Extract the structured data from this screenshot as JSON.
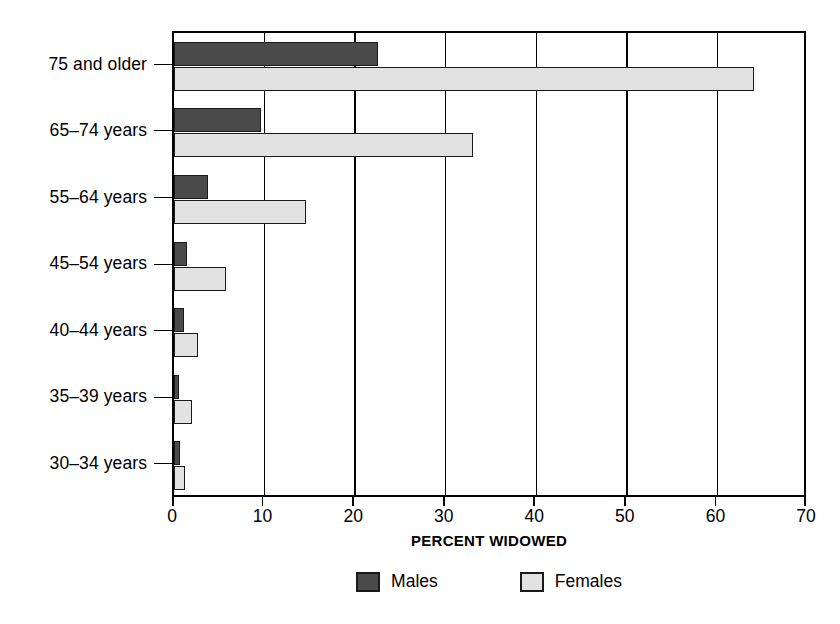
{
  "chart_data": {
    "type": "bar",
    "orientation": "horizontal",
    "title": "",
    "xlabel": "PERCENT WIDOWED",
    "ylabel": "",
    "xlim": [
      0,
      70
    ],
    "xticks": [
      0,
      10,
      20,
      30,
      40,
      50,
      60,
      70
    ],
    "xtick_labels": [
      "0",
      "10",
      "20",
      "30",
      "40",
      "50",
      "60",
      "70"
    ],
    "grid": true,
    "grid_axis": "x",
    "legend_position": "bottom",
    "categories": [
      "75 and older",
      "65–74 years",
      "55–64 years",
      "45–54 years",
      "40–44 years",
      "35–39 years",
      "30–34 years"
    ],
    "series": [
      {
        "name": "Males",
        "color": "#4a4a4a",
        "values": [
          22.5,
          9.6,
          3.7,
          1.4,
          1.1,
          0.6,
          0.7
        ]
      },
      {
        "name": "Females",
        "color": "#e2e2e2",
        "values": [
          64.0,
          33.0,
          14.6,
          5.7,
          2.6,
          2.0,
          1.2
        ]
      }
    ]
  },
  "legend": {
    "items": [
      {
        "label": "Males",
        "swatch": "male"
      },
      {
        "label": "Females",
        "swatch": "female"
      }
    ]
  },
  "colors": {
    "male_bar": "#4a4a4a",
    "female_bar": "#e2e2e2",
    "outline": "#1a1a1a",
    "background": "#ffffff"
  }
}
